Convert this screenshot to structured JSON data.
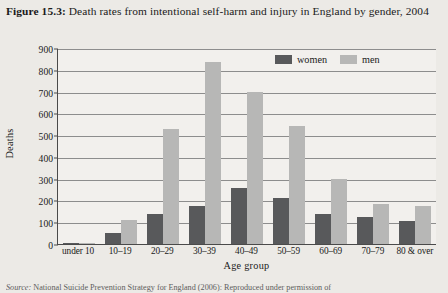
{
  "figure": {
    "label": "Figure 15.3:",
    "caption": " Death rates from intentional self-harm and injury in England by gender, 2004"
  },
  "source": {
    "label": "Source:",
    "text": " National Suicide Prevention Strategy for England (2006): Reproduced under permission of"
  },
  "legend": {
    "position": "top-right",
    "entries": [
      {
        "label": "women",
        "color": "#58595b"
      },
      {
        "label": "men",
        "color": "#b7b7b6"
      }
    ]
  },
  "chart_data": {
    "type": "bar",
    "title": "Death rates from intentional self-harm and injury in England by gender, 2004",
    "xlabel": "Age group",
    "ylabel": "Deaths",
    "ylim": [
      0,
      900
    ],
    "ystep": 100,
    "yticks": [
      900,
      800,
      700,
      600,
      500,
      400,
      300,
      200,
      100,
      0
    ],
    "grid": true,
    "categories": [
      "under 10",
      "10–19",
      "20–29",
      "30–39",
      "40–49",
      "50–59",
      "60–69",
      "70–79",
      "80 & over"
    ],
    "series": [
      {
        "name": "women",
        "color": "#58595b",
        "values": [
          5,
          50,
          140,
          175,
          255,
          210,
          140,
          125,
          105
        ]
      },
      {
        "name": "men",
        "color": "#b7b7b6",
        "values": [
          3,
          110,
          530,
          835,
          700,
          540,
          300,
          185,
          175
        ]
      }
    ]
  }
}
